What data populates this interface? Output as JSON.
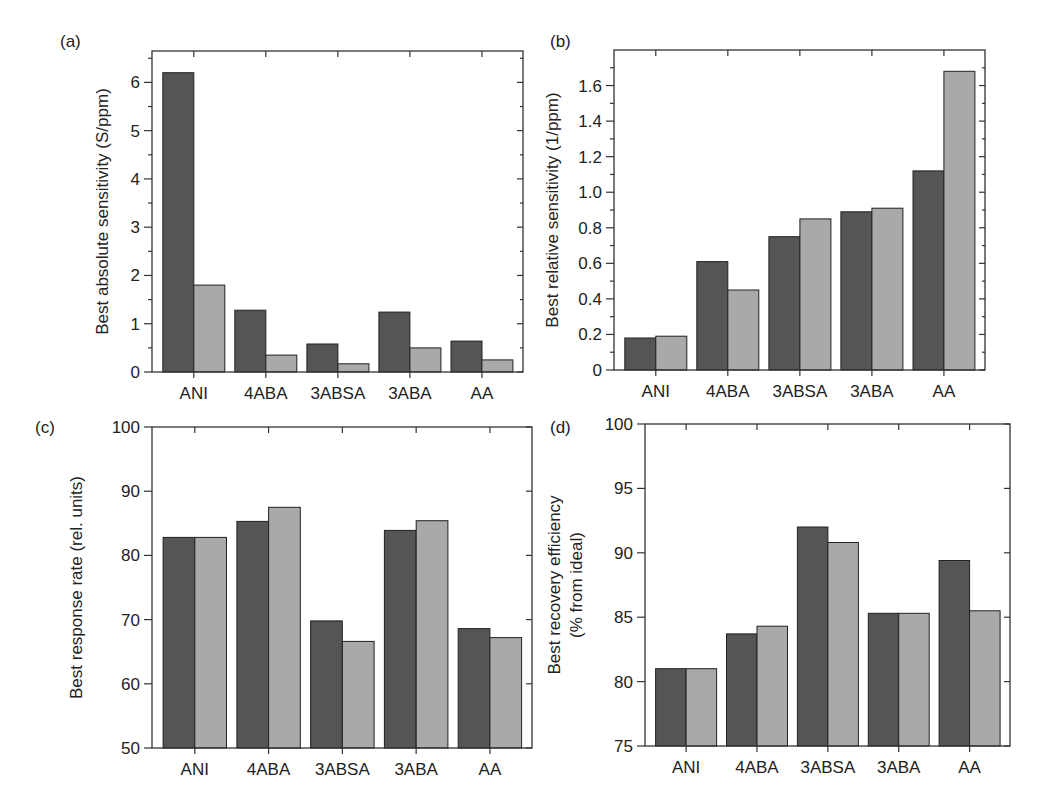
{
  "figure": {
    "series_names": [
      "Series 1 (dark)",
      "Series 2 (light)"
    ],
    "colors": {
      "dark": "#555555",
      "light": "#a9a9a9"
    }
  },
  "chart_data": [
    {
      "type": "bar",
      "panel_label": "(a)",
      "title": "",
      "xlabel": "",
      "ylabel": "Best absolute sensitivity (S/ppm)",
      "categories": [
        "ANI",
        "4ABA",
        "3ABSA",
        "3ABA",
        "AA"
      ],
      "ylim": [
        0,
        6.65
      ],
      "yticks": [
        0,
        1,
        2,
        3,
        4,
        5,
        6
      ],
      "ytick_labels": [
        "0",
        "1",
        "2",
        "3",
        "4",
        "5",
        "6"
      ],
      "minor_step": 0.5,
      "grid": false,
      "series": [
        {
          "name": "dark",
          "values": [
            6.2,
            1.28,
            0.58,
            1.24,
            0.64
          ]
        },
        {
          "name": "light",
          "values": [
            1.8,
            0.35,
            0.17,
            0.5,
            0.25
          ]
        }
      ]
    },
    {
      "type": "bar",
      "panel_label": "(b)",
      "title": "",
      "xlabel": "",
      "ylabel": "Best relative sensitivity (1/ppm)",
      "categories": [
        "ANI",
        "4ABA",
        "3ABSA",
        "3ABA",
        "AA"
      ],
      "ylim": [
        0,
        1.8
      ],
      "yticks": [
        0,
        0.2,
        0.4,
        0.6,
        0.8,
        1.0,
        1.2,
        1.4,
        1.6
      ],
      "ytick_labels": [
        "0",
        "0.2",
        "0.4",
        "0.6",
        "0.8",
        "1.0",
        "1.2",
        "1.4",
        "1.6"
      ],
      "minor_step": 0.1,
      "grid": false,
      "series": [
        {
          "name": "dark",
          "values": [
            0.18,
            0.61,
            0.75,
            0.89,
            1.12
          ]
        },
        {
          "name": "light",
          "values": [
            0.19,
            0.45,
            0.85,
            0.91,
            1.68
          ]
        }
      ]
    },
    {
      "type": "bar",
      "panel_label": "(c)",
      "title": "",
      "xlabel": "",
      "ylabel": "Best response rate (rel. units)",
      "categories": [
        "ANI",
        "4ABA",
        "3ABSA",
        "3ABA",
        "AA"
      ],
      "ylim": [
        50,
        100
      ],
      "yticks": [
        50,
        60,
        70,
        80,
        90,
        100
      ],
      "ytick_labels": [
        "50",
        "60",
        "70",
        "80",
        "90",
        "100"
      ],
      "minor_step": 0,
      "grid": false,
      "series": [
        {
          "name": "dark",
          "values": [
            82.8,
            85.3,
            69.8,
            83.9,
            68.6
          ]
        },
        {
          "name": "light",
          "values": [
            82.8,
            87.5,
            66.6,
            85.4,
            67.2
          ]
        }
      ]
    },
    {
      "type": "bar",
      "panel_label": "(d)",
      "title": "",
      "xlabel": "",
      "ylabel": "Best recovery efficiency",
      "ylabel2": "(% from ideal)",
      "categories": [
        "ANI",
        "4ABA",
        "3ABSA",
        "3ABA",
        "AA"
      ],
      "ylim": [
        75,
        100
      ],
      "yticks": [
        75,
        80,
        85,
        90,
        95,
        100
      ],
      "ytick_labels": [
        "75",
        "80",
        "85",
        "90",
        "95",
        "100"
      ],
      "minor_step": 0,
      "grid": false,
      "series": [
        {
          "name": "dark",
          "values": [
            81.0,
            83.7,
            92.0,
            85.3,
            89.4
          ]
        },
        {
          "name": "light",
          "values": [
            81.0,
            84.3,
            90.8,
            85.3,
            85.5
          ]
        }
      ]
    }
  ]
}
